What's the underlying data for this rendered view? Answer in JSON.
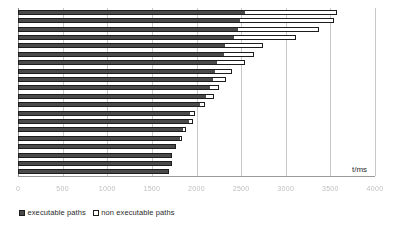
{
  "chart_data": {
    "type": "bar",
    "orientation": "horizontal",
    "stacked": true,
    "title": "",
    "subtitle": "",
    "xlabel": "t/ms",
    "ylabel": "",
    "xlim": [
      0,
      4000
    ],
    "grid": true,
    "grid_axis": "x",
    "legend_position": "bottom-left",
    "categories": [
      "1",
      "2",
      "3",
      "4",
      "5",
      "6",
      "7",
      "8",
      "9",
      "10",
      "11",
      "12",
      "13",
      "14",
      "15",
      "16",
      "17",
      "18",
      "19",
      "20"
    ],
    "xticks": [
      0,
      500,
      1000,
      1500,
      2000,
      2500,
      3000,
      3500,
      4000
    ],
    "xticklabels": [
      "0",
      "500",
      "1000",
      "1500",
      "2000",
      "2500",
      "3000",
      "3500",
      "4000"
    ],
    "series": [
      {
        "name": "executable paths",
        "color": "#4a4a4a",
        "values": [
          2540,
          2490,
          2470,
          2420,
          2320,
          2310,
          2230,
          2210,
          2190,
          2150,
          2110,
          2040,
          1930,
          1920,
          1850,
          1820,
          1760,
          1730,
          1720,
          1690
        ]
      },
      {
        "name": "non executable paths",
        "color": "#ffffff",
        "values": [
          1030,
          1050,
          900,
          700,
          430,
          330,
          310,
          190,
          140,
          100,
          90,
          60,
          50,
          40,
          30,
          20,
          15,
          10,
          10,
          5
        ]
      }
    ],
    "totals": [
      3570,
      3540,
      3370,
      3120,
      2750,
      2640,
      2540,
      2400,
      2330,
      2250,
      2200,
      2100,
      1980,
      1960,
      1880,
      1840,
      1775,
      1740,
      1730,
      1695
    ]
  },
  "legend": {
    "items": [
      {
        "label": "executable paths",
        "swatch": "exec"
      },
      {
        "label": "non executable paths",
        "swatch": "nonexec"
      }
    ]
  },
  "axis": {
    "x_title": "t/ms"
  }
}
